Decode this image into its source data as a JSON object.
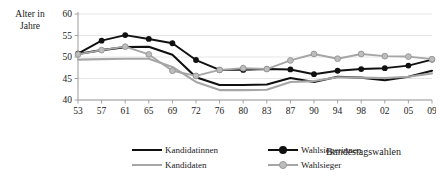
{
  "axis": {
    "y_title_line1": "Alter in",
    "y_title_line2": "Jahre",
    "x_title": "Bundestagswahlen",
    "y_ticks": [
      "60",
      "55",
      "50",
      "45",
      "40"
    ],
    "x_ticks": [
      "53",
      "57",
      "61",
      "65",
      "69",
      "72",
      "76",
      "80",
      "83",
      "87",
      "90",
      "94",
      "98",
      "02",
      "05",
      "09"
    ]
  },
  "legend": {
    "items": [
      {
        "label": "Kandidatinnen",
        "color": "#101010",
        "marker": false
      },
      {
        "label": "Kandidaten",
        "color": "#a6a6a6",
        "marker": false
      },
      {
        "label": "Wahlsiegerinnen",
        "color": "#101010",
        "marker": true
      },
      {
        "label": "Wahlsieger",
        "color": "#a6a6a6",
        "marker": true
      }
    ]
  },
  "footnote": "",
  "colors": {
    "black": "#101010",
    "gray": "#a6a6a6",
    "grid": "#e3e3e3",
    "axis": "#9b9b9b"
  },
  "chart_data": {
    "type": "line",
    "title": "",
    "xlabel": "Bundestagswahlen",
    "ylabel": "Alter in Jahre",
    "ylim": [
      40,
      60
    ],
    "yticks": [
      40,
      45,
      50,
      55,
      60
    ],
    "grid": true,
    "legend_position": "bottom",
    "categories": [
      "53",
      "57",
      "61",
      "65",
      "69",
      "72",
      "76",
      "80",
      "83",
      "87",
      "90",
      "94",
      "98",
      "02",
      "05",
      "09"
    ],
    "series": [
      {
        "name": "Kandidatinnen",
        "color": "#101010",
        "marker": false,
        "values": [
          50.7,
          51.6,
          52.3,
          52.4,
          50.5,
          45.3,
          43.5,
          43.5,
          43.6,
          45.1,
          44.2,
          45.4,
          45.2,
          44.6,
          45.4,
          46.8
        ]
      },
      {
        "name": "Kandidaten",
        "color": "#a6a6a6",
        "marker": false,
        "values": [
          49.4,
          49.5,
          49.6,
          49.6,
          47.7,
          44.2,
          42.3,
          42.3,
          42.4,
          44.2,
          44.4,
          45.3,
          45.2,
          45.1,
          45.4,
          46.2
        ]
      },
      {
        "name": "Wahlsiegerinnen",
        "color": "#101010",
        "marker": true,
        "values": [
          50.8,
          53.8,
          55.1,
          54.2,
          53.2,
          49.3,
          47.0,
          47.0,
          47.2,
          47.1,
          46.0,
          46.8,
          47.2,
          47.4,
          48.0,
          49.4
        ]
      },
      {
        "name": "Wahlsieger",
        "color": "#a6a6a6",
        "marker": true,
        "values": [
          50.6,
          51.6,
          52.4,
          50.6,
          46.8,
          45.6,
          47.0,
          47.4,
          47.2,
          49.2,
          50.7,
          49.6,
          50.7,
          50.2,
          50.1,
          49.5
        ]
      }
    ]
  }
}
